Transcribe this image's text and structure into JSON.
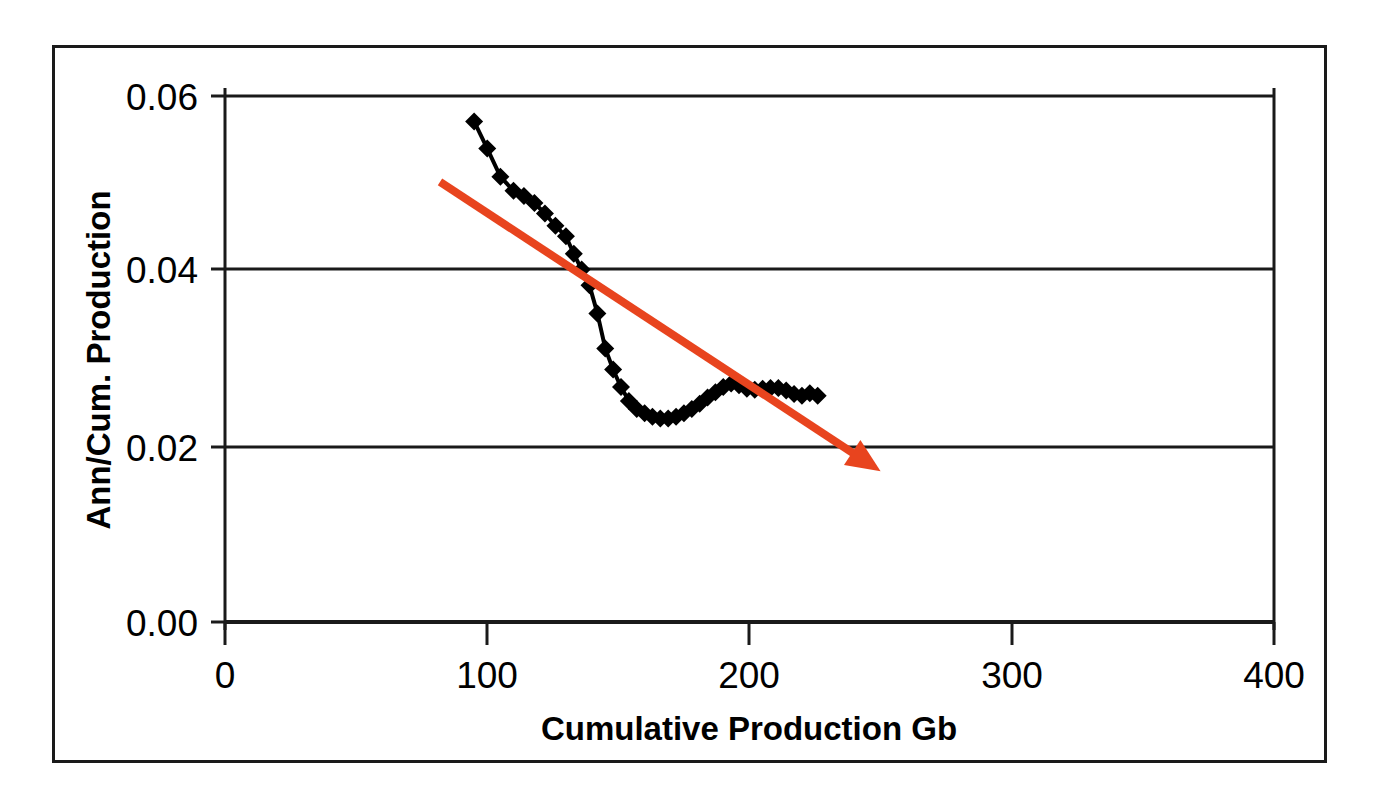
{
  "chart_data": {
    "type": "line",
    "title": "",
    "xlabel": "Cumulative Production Gb",
    "ylabel": "Ann/Cum. Production",
    "xlim": [
      0,
      400
    ],
    "ylim": [
      0.0,
      0.06
    ],
    "xticks": [
      "0",
      "100",
      "200",
      "300",
      "400"
    ],
    "xtick_values": [
      0,
      100,
      200,
      300,
      400
    ],
    "yticks": [
      "0.00",
      "0.02",
      "0.04",
      "0.06"
    ],
    "ytick_values": [
      0.0,
      0.02,
      0.04,
      0.06
    ],
    "grid": "horizontal",
    "legend": "none",
    "series": [
      {
        "name": "Ann/Cum. Production",
        "marker": "diamond",
        "color": "#000000",
        "x": [
          95,
          100,
          105,
          110,
          114,
          118,
          122,
          126,
          130,
          133,
          136,
          139,
          142,
          145,
          148,
          151,
          154,
          157,
          160,
          163,
          166,
          169,
          172,
          175,
          178,
          181,
          184,
          187,
          190,
          193,
          196,
          199,
          202,
          205,
          208,
          211,
          214,
          217,
          220,
          223,
          226
        ],
        "y": [
          0.0571,
          0.054,
          0.0508,
          0.0492,
          0.0486,
          0.0478,
          0.0466,
          0.0452,
          0.044,
          0.042,
          0.0402,
          0.0384,
          0.0352,
          0.0312,
          0.0288,
          0.0268,
          0.0252,
          0.0243,
          0.0238,
          0.0234,
          0.0232,
          0.0232,
          0.0234,
          0.0238,
          0.0243,
          0.0249,
          0.0256,
          0.0262,
          0.0268,
          0.0272,
          0.027,
          0.0266,
          0.0265,
          0.0266,
          0.0267,
          0.0267,
          0.0264,
          0.026,
          0.0258,
          0.0261,
          0.0258
        ]
      }
    ],
    "annotations": [
      {
        "type": "arrow",
        "name": "trend-arrow",
        "color": "#E8441E",
        "x_start": 82,
        "y_start": 0.0502,
        "x_end": 250,
        "y_end": 0.0172
      }
    ]
  },
  "axes": {
    "x_title": "Cumulative Production Gb",
    "y_title": "Ann/Cum. Production",
    "x_tick_labels": [
      "0",
      "100",
      "200",
      "300",
      "400"
    ],
    "y_tick_labels": [
      "0.00",
      "0.02",
      "0.04",
      "0.06"
    ]
  },
  "colors": {
    "series": "#000000",
    "trend_arrow": "#E8441E",
    "axis": "#1a1a1a",
    "grid": "#1a1a1a",
    "background": "#ffffff"
  }
}
